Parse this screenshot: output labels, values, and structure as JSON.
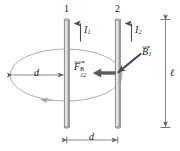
{
  "figure": {
    "background_color": "#ffffff",
    "wire_body_color": "#b9b9b7",
    "wire_edge_color": "#6e6e6c",
    "wire_highlight_color": "#e2e2e0",
    "field_line_color": "#9a9a98",
    "dimension_color": "#6a6a68",
    "arrow_color": "#4a4a48",
    "force_arrow_color": "#595957",
    "text_color": "#1a1a1a"
  },
  "labels": {
    "wire1_number": "1",
    "wire2_number": "2",
    "current1_symbol": "I",
    "current1_subscript": "1",
    "current2_symbol": "I",
    "current2_subscript": "2",
    "force_symbol": "F",
    "force_subscript": "12",
    "force_superscript": "B",
    "bfield_symbol": "B",
    "bfield_subscript": "1",
    "radius_dimension": "d",
    "separation_dimension": "d",
    "length_dimension": "ℓ"
  },
  "elements": {
    "wire1_name": "current-carrying-wire-1",
    "wire2_name": "current-carrying-wire-2",
    "field_loop_name": "magnetic-field-circular-loop",
    "force_arrow_name": "magnetic-force-arrow",
    "bfield_arrow_name": "magnetic-field-vector-arrow",
    "current1_arrow_name": "current-1-direction-arrow",
    "current2_arrow_name": "current-2-direction-arrow",
    "radius_dim_name": "radius-dimension-line",
    "separation_dim_name": "separation-dimension-line",
    "length_dim_name": "wire-length-dimension-line"
  }
}
